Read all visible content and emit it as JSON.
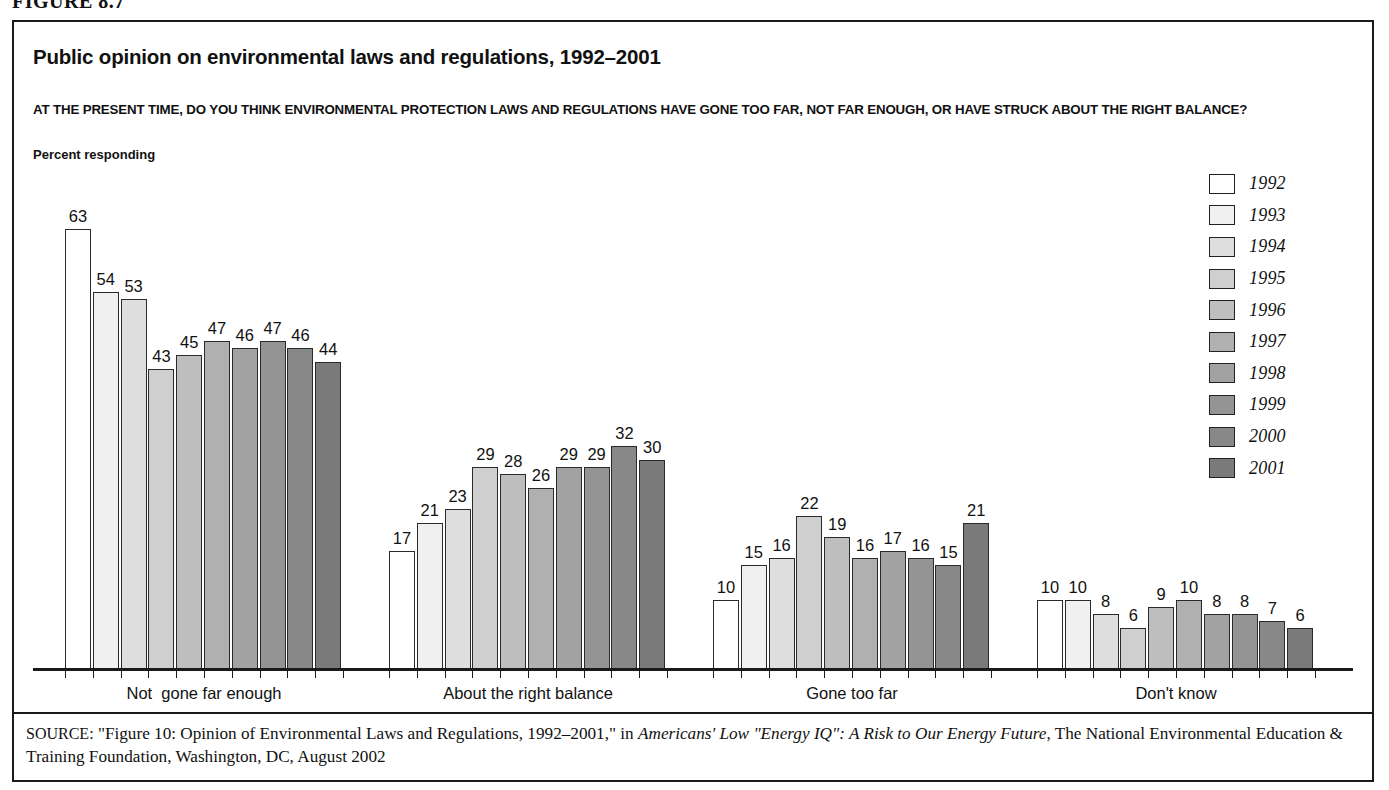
{
  "figure_number": "FIGURE 8.7",
  "header": {
    "title": "Public opinion on environmental laws and regulations, 1992–2001",
    "question": "AT THE PRESENT TIME, DO YOU THINK ENVIRONMENTAL PROTECTION LAWS AND REGULATIONS HAVE GONE TOO FAR, NOT FAR ENOUGH, OR HAVE STRUCK ABOUT THE RIGHT BALANCE?",
    "axis_note": "Percent responding"
  },
  "legend": {
    "entries": [
      {
        "label": "1992",
        "color": "#ffffff"
      },
      {
        "label": "1993",
        "color": "#f0f0f0"
      },
      {
        "label": "1994",
        "color": "#dedede"
      },
      {
        "label": "1995",
        "color": "#cfcfcf"
      },
      {
        "label": "1996",
        "color": "#bebebe"
      },
      {
        "label": "1997",
        "color": "#b0b0b0"
      },
      {
        "label": "1998",
        "color": "#a2a2a2"
      },
      {
        "label": "1999",
        "color": "#949494"
      },
      {
        "label": "2000",
        "color": "#888888"
      },
      {
        "label": "2001",
        "color": "#7a7a7a"
      }
    ]
  },
  "source": {
    "label": "SOURCE:",
    "text_1": " \"Figure 10: Opinion of Environmental Laws and Regulations, 1992–2001,\" in ",
    "italic": "Americans' Low \"Energy IQ\": A Risk to Our Energy Future",
    "text_2": ", The National Environmental Education & Training Foundation, Washington, DC, August 2002"
  },
  "chart_data": {
    "type": "bar",
    "title": "Public opinion on environmental laws and regulations, 1992–2001",
    "xlabel": "",
    "ylabel": "Percent responding",
    "ylim": [
      0,
      70
    ],
    "grid": false,
    "legend_position": "right",
    "categories": [
      "Not  gone far enough",
      "About the right balance",
      "Gone too far",
      "Don't know"
    ],
    "series": [
      {
        "name": "1992",
        "color": "#ffffff",
        "values": [
          63,
          17,
          10,
          10
        ]
      },
      {
        "name": "1993",
        "color": "#f0f0f0",
        "values": [
          54,
          21,
          15,
          10
        ]
      },
      {
        "name": "1994",
        "color": "#dedede",
        "values": [
          53,
          23,
          16,
          8
        ]
      },
      {
        "name": "1995",
        "color": "#cfcfcf",
        "values": [
          43,
          29,
          22,
          6
        ]
      },
      {
        "name": "1996",
        "color": "#bebebe",
        "values": [
          45,
          28,
          19,
          9
        ]
      },
      {
        "name": "1997",
        "color": "#b0b0b0",
        "values": [
          47,
          26,
          16,
          10
        ]
      },
      {
        "name": "1998",
        "color": "#a2a2a2",
        "values": [
          46,
          29,
          17,
          8
        ]
      },
      {
        "name": "1999",
        "color": "#949494",
        "values": [
          47,
          29,
          16,
          8
        ]
      },
      {
        "name": "2000",
        "color": "#888888",
        "values": [
          46,
          32,
          15,
          7
        ]
      },
      {
        "name": "2001",
        "color": "#7a7a7a",
        "values": [
          44,
          30,
          21,
          6
        ]
      }
    ]
  }
}
